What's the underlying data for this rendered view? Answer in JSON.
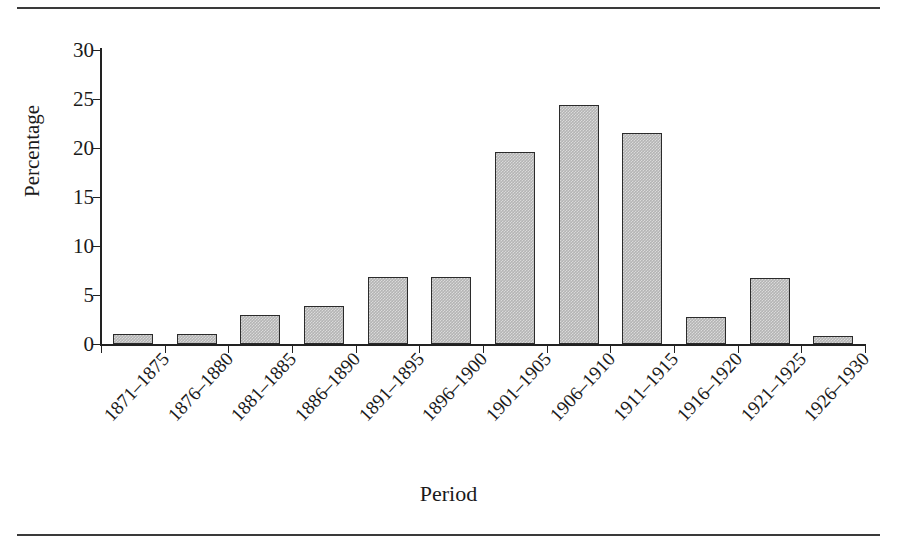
{
  "figure": {
    "top_rule": "",
    "bottom_rule": ""
  },
  "chart_data": {
    "type": "bar",
    "title": "",
    "xlabel": "Period",
    "ylabel": "Percentage",
    "categories": [
      "1871–1875",
      "1876–1880",
      "1881–1885",
      "1886–1890",
      "1891–1895",
      "1896–1900",
      "1901–1905",
      "1906–1910",
      "1911–1915",
      "1916–1920",
      "1921–1925",
      "1926–1930"
    ],
    "values": [
      1.0,
      1.0,
      3.0,
      3.9,
      6.8,
      6.8,
      19.6,
      24.4,
      21.5,
      2.8,
      6.7,
      0.8
    ],
    "ylim": [
      0,
      30
    ],
    "yticks": [
      0,
      5,
      10,
      15,
      20,
      25,
      30
    ],
    "ytick_labels": [
      "0",
      "5",
      "10",
      "15",
      "20",
      "25",
      "30"
    ],
    "grid": false,
    "legend": false,
    "bar_fill_color": "#b4b4b4",
    "bar_edge_color": "#2b2b2b",
    "axis_color": "#222222"
  }
}
